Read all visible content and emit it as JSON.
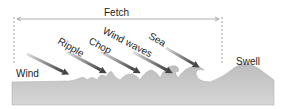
{
  "diagram": {
    "title": "Fetch",
    "labels": {
      "wind": "Wind",
      "ripple": "Ripple",
      "chop": "Chop",
      "wind_waves": "Wind waves",
      "sea": "Sea",
      "swell": "Swell"
    },
    "colors": {
      "water": "#c8c8c8",
      "arrow": "#555555",
      "fetch_line": "#888888",
      "text": "#222222"
    }
  }
}
